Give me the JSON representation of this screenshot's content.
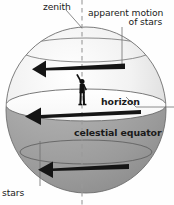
{
  "figure": {
    "background_color": "#fefefe"
  },
  "labels": {
    "zenith": "zenith",
    "apparent_motion_line1": "apparent motion",
    "apparent_motion_line2": "of stars",
    "horizon": "horizon",
    "celestial_equator": "celestial equator",
    "stars": "stars"
  },
  "colors": {
    "ink": "#1a1a1a",
    "sphere_upper_light": "#ffffff",
    "sphere_upper_mid": "#e8e8e8",
    "sphere_lower": "#9d9d9d",
    "sphere_outline": "#6e6e6e",
    "axis_dash": "#9a9a9a",
    "leader_line": "#6f6f6f",
    "arrow": "#151515"
  },
  "diagram_elements": {
    "sphere": {
      "center_x": 86,
      "center_y": 110,
      "radius_x": 80,
      "radius_y": 83
    },
    "rotation_axis": {
      "style": "dashed",
      "orientation": "vertical",
      "x": 82
    },
    "observer": {
      "description": "human figure standing at center of horizon plane",
      "x": 82,
      "y": 90
    },
    "star_paths": [
      {
        "name": "upper-star-circle",
        "y": 50,
        "arrow_direction": "left"
      },
      {
        "name": "horizon-circle",
        "y": 105,
        "arrow_direction": "left"
      },
      {
        "name": "lower-star-circle",
        "y": 152,
        "arrow_direction": "left"
      }
    ],
    "arrows": [
      {
        "name": "apparent-motion-arrow-top",
        "x1": 125,
        "x2": 32,
        "y": 67
      },
      {
        "name": "apparent-motion-arrow-middle",
        "x1": 140,
        "x2": 25,
        "y": 114
      },
      {
        "name": "apparent-motion-arrow-bottom",
        "x1": 128,
        "x2": 38,
        "y": 168
      }
    ]
  }
}
